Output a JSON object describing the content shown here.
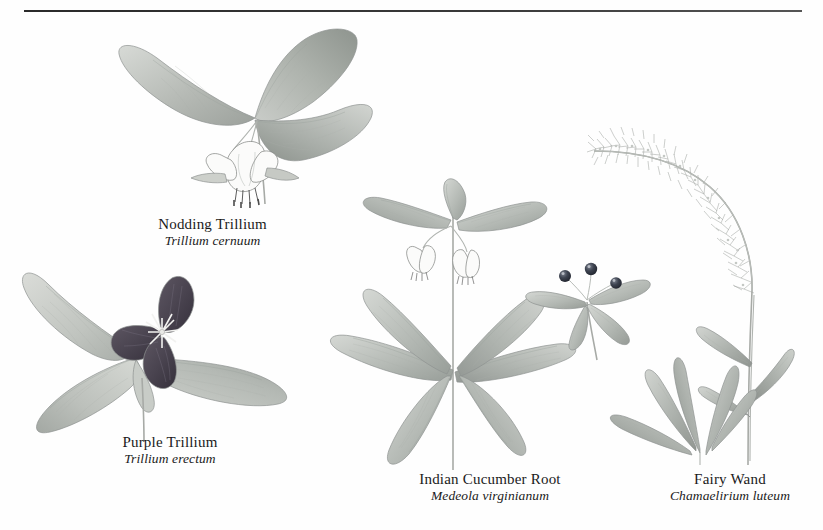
{
  "page": {
    "background_color": "#fefefe",
    "rule_color": "#2a2a2a",
    "kind": "botanical-illustration-plate"
  },
  "plants": [
    {
      "id": "nodding-trillium",
      "common_name": "Nodding Trillium",
      "scientific_name": "Trillium cernuum",
      "leaf_color": "#b9bdb8",
      "flower_color": "#fbfbfa",
      "description": "Three broad ovate leaves in a whorl with a white nodding flower below"
    },
    {
      "id": "purple-trillium",
      "common_name": "Purple Trillium",
      "scientific_name": "Trillium erectum",
      "leaf_color": "#c3c7c2",
      "flower_color": "#4a4450",
      "description": "Three broad leaves with a dark maroon three-petaled flower and white star center"
    },
    {
      "id": "indian-cucumber-root",
      "common_name": "Indian Cucumber Root",
      "scientific_name": "Medeola virginianum",
      "leaf_color": "#b7bcb7",
      "flower_color": "#f2f2ef",
      "berry_color": "#2b2f3a",
      "description": "Two whorls of lance leaves, pale drooping flowers, and a detail of dark berries"
    },
    {
      "id": "fairy-wand",
      "common_name": "Fairy Wand",
      "scientific_name": "Chamaelirium luteum",
      "leaf_color": "#b2b7b2",
      "flower_color": "#d8dad6",
      "description": "Arching feathery flower spike above a basal rosette of narrow leaves"
    }
  ]
}
